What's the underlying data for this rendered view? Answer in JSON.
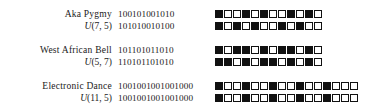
{
  "figure": {
    "name": "rhythm-comparison-figure",
    "colors": {
      "background": "#ffffff",
      "text": "#1a1a1a",
      "box_on": "#111111",
      "box_off": "#ffffff",
      "box_border": "#111111"
    },
    "rows": [
      {
        "name": "Aka Pygmy",
        "unit_symbol": "U",
        "unit_args": "(7, 5)",
        "unit_label": "U(7, 5)",
        "binary_top": "100101001010",
        "binary_bottom": "101010010100",
        "boxes_top": [
          1,
          0,
          0,
          1,
          0,
          1,
          0,
          0,
          1,
          0,
          1,
          0
        ],
        "boxes_bottom": [
          1,
          0,
          1,
          0,
          1,
          0,
          0,
          1,
          0,
          1,
          0,
          0
        ]
      },
      {
        "name": "West African Bell",
        "unit_symbol": "U",
        "unit_args": "(5, 7)",
        "unit_label": "U(5, 7)",
        "binary_top": "101101011010",
        "binary_bottom": "110101101010",
        "boxes_top": [
          1,
          0,
          1,
          1,
          0,
          1,
          0,
          1,
          1,
          0,
          1,
          0
        ],
        "boxes_bottom": [
          1,
          1,
          0,
          1,
          0,
          1,
          1,
          0,
          1,
          0,
          1,
          0
        ]
      },
      {
        "name": "Electronic Dance",
        "unit_symbol": "U",
        "unit_args": "(11, 5)",
        "unit_label": "U(11, 5)",
        "binary_top": "1001001001001000",
        "binary_bottom": "1001001001001000",
        "boxes_top": [
          1,
          0,
          0,
          1,
          0,
          0,
          1,
          0,
          0,
          1,
          0,
          0,
          1,
          0,
          0,
          0
        ],
        "boxes_bottom": [
          1,
          0,
          0,
          1,
          0,
          0,
          1,
          0,
          0,
          1,
          0,
          0,
          1,
          0,
          0,
          0
        ]
      }
    ]
  }
}
